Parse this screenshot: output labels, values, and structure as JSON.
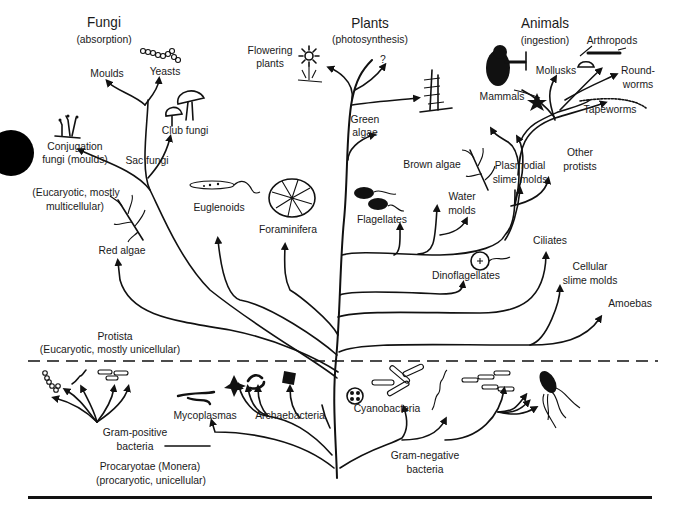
{
  "diagram": {
    "kingdoms": {
      "fungi": {
        "title": "Fungi",
        "subtitle": "(absorption)"
      },
      "plants": {
        "title": "Plants",
        "subtitle": "(photosynthesis)"
      },
      "animals": {
        "title": "Animals",
        "subtitle": "(ingestion)"
      }
    },
    "fungi": {
      "moulds": "Moulds",
      "yeasts": "Yeasts",
      "club_fungi": "Club fungi",
      "sac_fungi": "Sac fungi",
      "conjugation_1": "Conjugation",
      "conjugation_2": "fungi (moulds)"
    },
    "plants": {
      "flowering_1": "Flowering",
      "flowering_2": "plants",
      "unknown": "?",
      "green_algae_1": "Green",
      "green_algae_2": "algae"
    },
    "animals": {
      "mammals": "Mammals",
      "mollusks": "Mollusks",
      "arthropods": "Arthropods",
      "roundworms_1": "Round-",
      "roundworms_2": "worms",
      "tapeworms": "Tapeworms"
    },
    "protista": {
      "group_note_1": "(Eucaryotic, mostly",
      "group_note_2": "multicellular)",
      "red_algae": "Red algae",
      "euglenoids": "Euglenoids",
      "foraminifera": "Foraminifera",
      "flagellates": "Flagellates",
      "brown_algae": "Brown algae",
      "water_molds_1": "Water",
      "water_molds_2": "molds",
      "plasmodial_1": "Plasmodial",
      "plasmodial_2": "slime molds",
      "other_protists_1": "Other",
      "other_protists_2": "protists",
      "dinoflagellates": "Dinoflagellates",
      "ciliates": "Ciliates",
      "cellular_slime_1": "Cellular",
      "cellular_slime_2": "slime molds",
      "amoebas": "Amoebas",
      "title": "Protista",
      "subtitle": "(Eucaryotic, mostly unicellular)"
    },
    "monera": {
      "gram_positive_1": "Gram-positive",
      "gram_positive_2": "bacteria",
      "mycoplasmas": "Mycoplasmas",
      "archaebacteria": "Archaebacteria",
      "cyanobacteria": "Cyanobacteria",
      "gram_negative_1": "Gram-negative",
      "gram_negative_2": "bacteria",
      "title": "Procaryotae (Monera)",
      "subtitle": "(procaryotic, unicellular)"
    }
  }
}
